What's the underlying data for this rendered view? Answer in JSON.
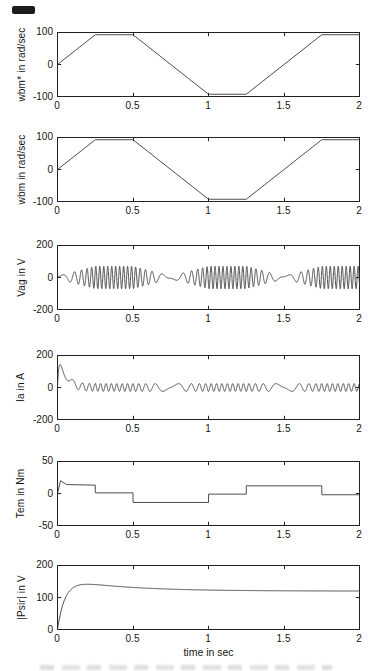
{
  "figure": {
    "xlabel": "time in sec",
    "x_tick_labels": [
      "0",
      "0.5",
      "1",
      "1.5",
      "2"
    ],
    "line_color": "#3a3a3a",
    "axis_color": "#222222",
    "speed_profile": {
      "points": [
        [
          0,
          0
        ],
        [
          0.25,
          93
        ],
        [
          0.5,
          93
        ],
        [
          1,
          -93
        ],
        [
          1.25,
          -93
        ],
        [
          1.75,
          93
        ],
        [
          2,
          93
        ]
      ],
      "speed_ref": 93
    }
  },
  "chart_data": [
    {
      "type": "line",
      "name": "wbm-ref",
      "ylabel": "wbm* in rad/sec",
      "yticks": [
        "100",
        "0",
        "-100"
      ],
      "ylim": [
        -100,
        100
      ],
      "xticks": [
        0,
        0.5,
        1,
        1.5,
        2
      ],
      "xlim": [
        0,
        2
      ],
      "grid": false,
      "signal": {
        "kind": "piecewise",
        "points": [
          [
            0,
            0
          ],
          [
            0.25,
            93
          ],
          [
            0.5,
            93
          ],
          [
            1,
            -93
          ],
          [
            1.25,
            -93
          ],
          [
            1.75,
            93
          ],
          [
            2,
            93
          ]
        ]
      }
    },
    {
      "type": "line",
      "name": "wbm",
      "ylabel": "wbm in rad/sec",
      "yticks": [
        "100",
        "0",
        "-100"
      ],
      "ylim": [
        -100,
        100
      ],
      "xticks": [
        0,
        0.5,
        1,
        1.5,
        2
      ],
      "xlim": [
        0,
        2
      ],
      "grid": false,
      "signal": {
        "kind": "piecewise",
        "points": [
          [
            0,
            0
          ],
          [
            0.25,
            93
          ],
          [
            0.5,
            93
          ],
          [
            1,
            -93
          ],
          [
            1.25,
            -93
          ],
          [
            1.75,
            93
          ],
          [
            2,
            93
          ]
        ]
      }
    },
    {
      "type": "line",
      "name": "vag",
      "ylabel": "Vag in V",
      "yticks": [
        "200",
        "0",
        "-200"
      ],
      "ylim": [
        -200,
        200
      ],
      "xticks": [
        0,
        0.5,
        1,
        1.5,
        2
      ],
      "xlim": [
        0,
        2
      ],
      "grid": false,
      "signal": {
        "kind": "am_sine",
        "amp_base": 8,
        "amp_speed": 62,
        "freq_base": 2,
        "freq_speed": 36,
        "phase0": 0.6
      }
    },
    {
      "type": "line",
      "name": "ia",
      "ylabel": "Ia in A",
      "yticks": [
        "200",
        "0",
        "-200"
      ],
      "ylim": [
        -200,
        200
      ],
      "xticks": [
        0,
        0.5,
        1,
        1.5,
        2
      ],
      "xlim": [
        0,
        2
      ],
      "grid": false,
      "signal": {
        "kind": "current",
        "trans_a": 320,
        "trans_tau1": 0.04,
        "trans_tau2": 0.01,
        "osc_amp": 24,
        "freq_base": 2,
        "freq_speed": 26,
        "phase0": 3.14,
        "peak_value": 150
      }
    },
    {
      "type": "line",
      "name": "tem",
      "ylabel": "Tem in Nm",
      "yticks": [
        "50",
        "0",
        "-50"
      ],
      "ylim": [
        -50,
        50
      ],
      "xticks": [
        0,
        0.5,
        1,
        1.5,
        2
      ],
      "xlim": [
        0,
        2
      ],
      "grid": false,
      "signal": {
        "kind": "piecewise",
        "points": [
          [
            0,
            0
          ],
          [
            0.02,
            20
          ],
          [
            0.06,
            14
          ],
          [
            0.25,
            13
          ],
          [
            0.2505,
            1
          ],
          [
            0.5,
            1
          ],
          [
            0.5005,
            -14
          ],
          [
            1,
            -14
          ],
          [
            1.0005,
            -1
          ],
          [
            1.25,
            -1
          ],
          [
            1.2505,
            12
          ],
          [
            1.75,
            12
          ],
          [
            1.7505,
            -2
          ],
          [
            2,
            -2
          ]
        ]
      }
    },
    {
      "type": "line",
      "name": "psir",
      "ylabel": "|Psir| in V",
      "yticks": [
        "200",
        "100",
        "0"
      ],
      "ylim": [
        0,
        200
      ],
      "xticks": [
        0,
        0.5,
        1,
        1.5,
        2
      ],
      "xlim": [
        0,
        2
      ],
      "grid": false,
      "xlabel": "time in sec",
      "signal": {
        "kind": "double_exp",
        "a1": 160,
        "tau1": 0.05,
        "a2": 40,
        "tau2": 0.4,
        "settle_value": 120,
        "peak_value": 144
      }
    }
  ]
}
